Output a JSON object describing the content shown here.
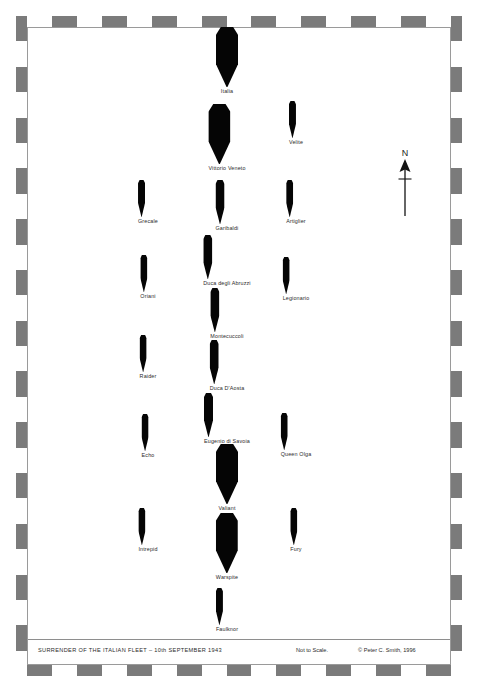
{
  "caption": {
    "title": "SURRENDER OF THE ITALIAN FLEET – 10th SEPTEMBER 1943",
    "scale_note": "Not to Scale.",
    "copyright": "© Peter C. Smith, 1996"
  },
  "compass": {
    "north_label": "N",
    "icon": "north-arrow-icon"
  },
  "colors": {
    "ink": "#050505",
    "border_dark": "#7b7b7b",
    "border_light": "#ffffff",
    "rule": "#9a9a9a",
    "label_text": "#2b2b2b"
  },
  "map": {
    "columns": [
      {
        "id": "left",
        "name": "left-escort-column"
      },
      {
        "id": "center",
        "name": "center-main-column"
      },
      {
        "id": "right",
        "name": "right-escort-column"
      }
    ],
    "ships": [
      {
        "name": "Italia",
        "column": "center",
        "x": 227,
        "y": 27,
        "class": "battleship",
        "width": 22,
        "height": 60
      },
      {
        "name": "Vittorio Veneto",
        "column": "center",
        "x": 227,
        "y": 104,
        "class": "battleship",
        "width": 22,
        "height": 60
      },
      {
        "name": "Velite",
        "column": "right",
        "x": 296,
        "y": 101,
        "class": "destroyer",
        "width": 7,
        "height": 37
      },
      {
        "name": "Grecale",
        "column": "left",
        "x": 148,
        "y": 180,
        "class": "destroyer",
        "width": 7,
        "height": 37
      },
      {
        "name": "Garibaldi",
        "column": "center",
        "x": 227,
        "y": 180,
        "class": "cruiser",
        "width": 9,
        "height": 44
      },
      {
        "name": "Artiglier",
        "column": "right",
        "x": 296,
        "y": 180,
        "class": "destroyer",
        "width": 7,
        "height": 37
      },
      {
        "name": "Duca degli Abruzzi",
        "column": "center",
        "x": 227,
        "y": 235,
        "class": "cruiser",
        "width": 9,
        "height": 44
      },
      {
        "name": "Oriani",
        "column": "left",
        "x": 148,
        "y": 255,
        "class": "destroyer",
        "width": 7,
        "height": 37
      },
      {
        "name": "Legionario",
        "column": "right",
        "x": 296,
        "y": 257,
        "class": "destroyer",
        "width": 7,
        "height": 37
      },
      {
        "name": "Montecuccoli",
        "column": "center",
        "x": 227,
        "y": 288,
        "class": "cruiser",
        "width": 9,
        "height": 44
      },
      {
        "name": "Raider",
        "column": "left",
        "x": 148,
        "y": 335,
        "class": "destroyer",
        "width": 7,
        "height": 37
      },
      {
        "name": "Duca D'Aosta",
        "column": "center",
        "x": 227,
        "y": 340,
        "class": "cruiser",
        "width": 9,
        "height": 44
      },
      {
        "name": "Eugenio di Savoia",
        "column": "center",
        "x": 227,
        "y": 393,
        "class": "cruiser",
        "width": 9,
        "height": 44
      },
      {
        "name": "Echo",
        "column": "left",
        "x": 148,
        "y": 414,
        "class": "destroyer",
        "width": 7,
        "height": 37
      },
      {
        "name": "Queen Olga",
        "column": "right",
        "x": 296,
        "y": 413,
        "class": "destroyer",
        "width": 7,
        "height": 37
      },
      {
        "name": "Valiant",
        "column": "center",
        "x": 227,
        "y": 444,
        "class": "battleship",
        "width": 22,
        "height": 60
      },
      {
        "name": "Intrepid",
        "column": "left",
        "x": 148,
        "y": 508,
        "class": "destroyer",
        "width": 7,
        "height": 37
      },
      {
        "name": "Fury",
        "column": "right",
        "x": 296,
        "y": 508,
        "class": "destroyer",
        "width": 7,
        "height": 37
      },
      {
        "name": "Warspite",
        "column": "center",
        "x": 227,
        "y": 513,
        "class": "battleship",
        "width": 22,
        "height": 60
      },
      {
        "name": "Faulknor",
        "column": "center",
        "x": 227,
        "y": 588,
        "class": "destroyer",
        "width": 7,
        "height": 37
      }
    ]
  },
  "border": {
    "top_cells": [
      "black",
      "light",
      "dark",
      "light",
      "dark",
      "light",
      "dark",
      "light",
      "dark",
      "light",
      "dark",
      "light",
      "dark",
      "light",
      "dark",
      "light",
      "dark",
      "light",
      "black"
    ],
    "bottom_cells": [
      "black",
      "dark",
      "light",
      "dark",
      "light",
      "dark",
      "light",
      "dark",
      "light",
      "dark",
      "light",
      "dark",
      "light",
      "dark",
      "light",
      "dark",
      "light",
      "dark",
      "black"
    ],
    "left_cells": [
      "dark",
      "light",
      "dark",
      "light",
      "dark",
      "light",
      "dark",
      "light",
      "dark",
      "light",
      "dark",
      "light",
      "dark",
      "light",
      "dark",
      "light",
      "dark",
      "light",
      "dark",
      "light",
      "dark",
      "light",
      "dark",
      "light",
      "dark",
      "light"
    ],
    "right_cells": [
      "dark",
      "light",
      "dark",
      "light",
      "dark",
      "light",
      "dark",
      "light",
      "dark",
      "light",
      "dark",
      "light",
      "dark",
      "light",
      "dark",
      "light",
      "dark",
      "light",
      "dark",
      "light",
      "dark",
      "light",
      "dark",
      "light",
      "dark",
      "light"
    ]
  }
}
